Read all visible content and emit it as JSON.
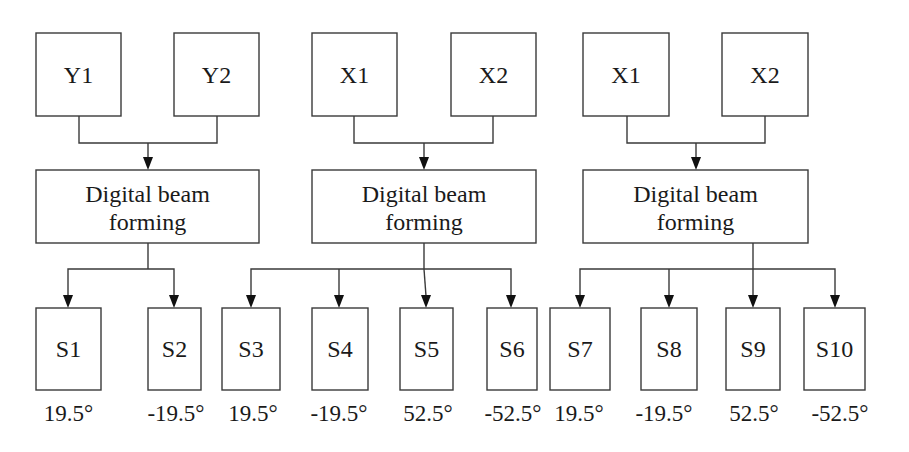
{
  "diagram": {
    "groups": [
      {
        "inputs": [
          "Y1",
          "Y2"
        ],
        "processor": {
          "line1": "Digital beam",
          "line2": "forming"
        },
        "outputs": [
          {
            "name": "S1",
            "angle": "19.5°"
          },
          {
            "name": "S2",
            "angle": "-19.5°"
          }
        ]
      },
      {
        "inputs": [
          "X1",
          "X2"
        ],
        "processor": {
          "line1": "Digital beam",
          "line2": "forming"
        },
        "outputs": [
          {
            "name": "S3",
            "angle": "19.5°"
          },
          {
            "name": "S4",
            "angle": "-19.5°"
          },
          {
            "name": "S5",
            "angle": "52.5°"
          },
          {
            "name": "S6",
            "angle": "-52.5°"
          }
        ]
      },
      {
        "inputs": [
          "X1",
          "X2"
        ],
        "processor": {
          "line1": "Digital beam",
          "line2": "forming"
        },
        "outputs": [
          {
            "name": "S7",
            "angle": "19.5°"
          },
          {
            "name": "S8",
            "angle": "-19.5°"
          },
          {
            "name": "S9",
            "angle": "52.5°"
          },
          {
            "name": "S10",
            "angle": "-52.5°"
          }
        ]
      }
    ]
  }
}
